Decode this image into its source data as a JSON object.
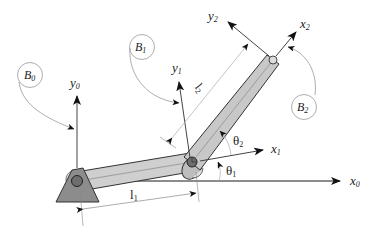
{
  "diagram": {
    "type": "two-link planar manipulator",
    "frames": {
      "frame0": {
        "x_label": "x",
        "x_sub": "0",
        "y_label": "y",
        "y_sub": "0"
      },
      "frame1": {
        "x_label": "x",
        "x_sub": "1",
        "y_label": "y",
        "y_sub": "1"
      },
      "frame2": {
        "x_label": "x",
        "x_sub": "2",
        "y_label": "y",
        "y_sub": "2"
      }
    },
    "bodies": [
      {
        "label": "B",
        "sub": "0"
      },
      {
        "label": "B",
        "sub": "1"
      },
      {
        "label": "B",
        "sub": "2"
      }
    ],
    "links": [
      {
        "label": "l",
        "sub": "1"
      },
      {
        "label": "l",
        "sub": "2"
      }
    ],
    "angles": [
      {
        "label": "θ",
        "sub": "1"
      },
      {
        "label": "θ",
        "sub": "2"
      }
    ],
    "colors": {
      "link_fill": "#c8c8c8",
      "base_fill": "#8c8c8c",
      "joint_fill": "#6e6e6e",
      "stroke": "#333333",
      "thin_line": "#9a9a9a"
    }
  }
}
